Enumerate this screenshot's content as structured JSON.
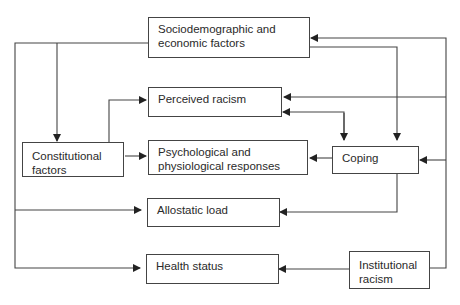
{
  "diagram": {
    "type": "flow",
    "nodes": [
      {
        "id": "socio",
        "label": "Sociodemographic and\neconomic factors"
      },
      {
        "id": "perceived",
        "label": "Perceived racism"
      },
      {
        "id": "constitutional",
        "label": "Constitutional\nfactors"
      },
      {
        "id": "psych",
        "label": "Psychological and\nphysiological responses"
      },
      {
        "id": "coping",
        "label": "Coping"
      },
      {
        "id": "allostatic",
        "label": "Allostatic load"
      },
      {
        "id": "health",
        "label": "Health status"
      },
      {
        "id": "institutional",
        "label": "Institutional\nracism"
      }
    ],
    "edges": [
      {
        "from": "socio",
        "to": "constitutional"
      },
      {
        "from": "socio",
        "to": "allostatic"
      },
      {
        "from": "socio",
        "to": "health"
      },
      {
        "from": "socio",
        "to": "coping"
      },
      {
        "from": "constitutional",
        "to": "perceived"
      },
      {
        "from": "constitutional",
        "to": "psych"
      },
      {
        "from": "coping",
        "to": "perceived"
      },
      {
        "from": "perceived",
        "to": "coping"
      },
      {
        "from": "coping",
        "to": "psych"
      },
      {
        "from": "coping",
        "to": "allostatic"
      },
      {
        "from": "institutional",
        "to": "socio"
      },
      {
        "from": "institutional",
        "to": "perceived"
      },
      {
        "from": "institutional",
        "to": "coping"
      },
      {
        "from": "institutional",
        "to": "health"
      }
    ]
  }
}
